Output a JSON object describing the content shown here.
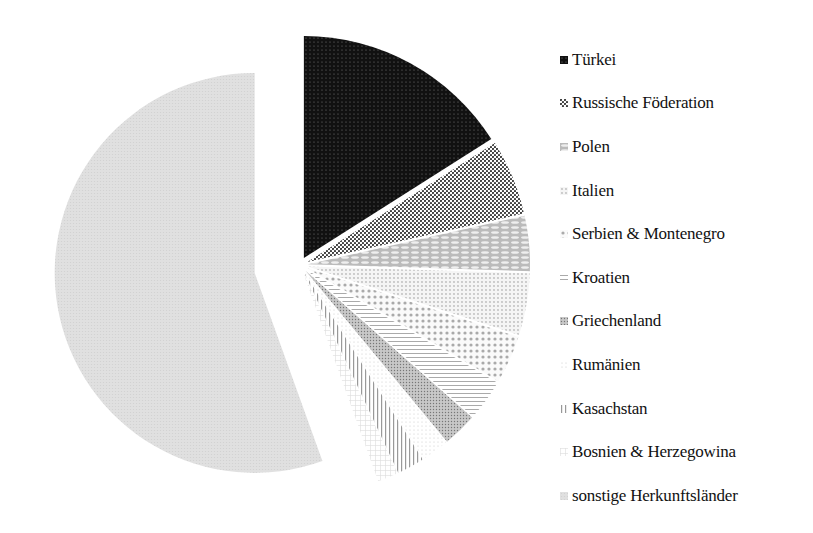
{
  "chart_data": {
    "type": "pie",
    "title": "",
    "exploded": true,
    "start_angle_deg": 0,
    "direction": "clockwise",
    "legend_position": "right",
    "categories": [
      "Türkei",
      "Russische Föderation",
      "Polen",
      "Italien",
      "Serbien & Montenegro",
      "Kroatien",
      "Griechenland",
      "Rumänien",
      "Kasachstan",
      "Bosnien & Herzegowina",
      "sonstige Herkunftsländer"
    ],
    "values": [
      16,
      5.5,
      4,
      4.5,
      3.5,
      3,
      2.5,
      2,
      2,
      1.5,
      55.5
    ],
    "value_unit": "percent (estimated from slice angles, not labeled)",
    "fills": [
      {
        "base": "#111111",
        "pattern": "dots-dense-dark"
      },
      {
        "base": "#555555",
        "pattern": "dots-dark"
      },
      {
        "base": "#9a9a9a",
        "pattern": "weave"
      },
      {
        "base": "#dcdcdc",
        "pattern": "dots-light"
      },
      {
        "base": "#c4c4c4",
        "pattern": "large-dots"
      },
      {
        "base": "#cfcfcf",
        "pattern": "horizontal-lines"
      },
      {
        "base": "#a8a8a8",
        "pattern": "speckle"
      },
      {
        "base": "#e4e4e4",
        "pattern": "light-speckle"
      },
      {
        "base": "#b5b5b5",
        "pattern": "vertical-lines"
      },
      {
        "base": "#e8e8e8",
        "pattern": "faint-grid"
      },
      {
        "base": "#dadada",
        "pattern": "solid-light"
      }
    ]
  },
  "legend": {
    "items": [
      {
        "label": "Türkei"
      },
      {
        "label": "Russische Föderation"
      },
      {
        "label": "Polen"
      },
      {
        "label": "Italien"
      },
      {
        "label": "Serbien & Montenegro"
      },
      {
        "label": "Kroatien"
      },
      {
        "label": "Griechenland"
      },
      {
        "label": "Rumänien"
      },
      {
        "label": "Kasachstan"
      },
      {
        "label": "Bosnien & Herzegowina"
      },
      {
        "label": "sonstige Herkunftsländer"
      }
    ]
  }
}
